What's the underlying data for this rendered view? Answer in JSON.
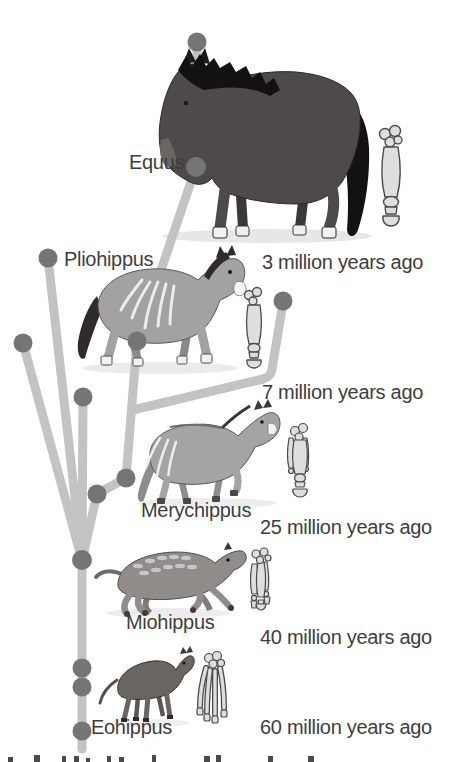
{
  "figure": {
    "lineage_oldest_to_newest": [
      "Eohippus",
      "Miohippus",
      "Merychippus",
      "Pliohippus",
      "Equus"
    ],
    "colors": {
      "background": "#ffffff",
      "branch": "#c3c3c3",
      "node": "#757575",
      "label_text": "#3e3d3d",
      "equus_body": "#4e4a49",
      "equus_mane_tail": "#141210",
      "gray_horse_body": "#a3a2a1",
      "miohippus_body": "#8f8c8a",
      "eohippus_body": "#6b6562",
      "bone_fill": "#dedede",
      "bone_outline": "#4b4b4b",
      "hoof_white": "#f2f2f2"
    }
  },
  "labels": {
    "equus": "Equus",
    "pliohippus": "Pliohippus",
    "merychippus": "Merychippus",
    "miohippus": "Miohippus",
    "eohippus": "Eohippus",
    "time_3mya": "3 million years ago",
    "time_7mya": "7 million years ago",
    "time_25mya": "25 million years ago",
    "time_40mya": "40 million years ago",
    "time_60mya": "60 million years ago"
  }
}
